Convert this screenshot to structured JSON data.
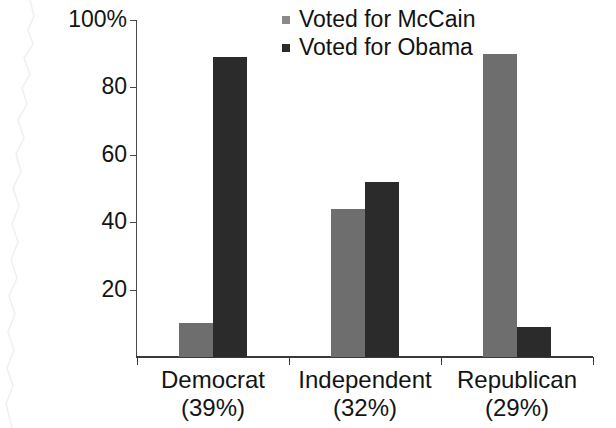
{
  "chart_data": {
    "type": "bar",
    "title": "",
    "subtitle": "",
    "xlabel": "",
    "ylabel": "",
    "ylim": [
      0,
      100
    ],
    "yticks": [
      20,
      40,
      60,
      80,
      100
    ],
    "ytick_labels": [
      "20",
      "40",
      "60",
      "80",
      "100%"
    ],
    "grid": false,
    "legend_position": "top-center",
    "categories": [
      "Democrat",
      "Independent",
      "Republican"
    ],
    "category_sublabels": [
      "(39%)",
      "(32%)",
      "(29%)"
    ],
    "series": [
      {
        "name": "Voted for McCain",
        "color": "#6e6e6e",
        "values": [
          10,
          44,
          90
        ]
      },
      {
        "name": "Voted for Obama",
        "color": "#2b2b2b",
        "values": [
          89,
          52,
          9
        ]
      }
    ]
  },
  "legend": {
    "items": [
      {
        "label": "Voted for McCain",
        "swatch": "legend-swatch-mccain"
      },
      {
        "label": "Voted for Obama",
        "swatch": "legend-swatch-obama"
      }
    ]
  },
  "axes": {
    "y": {
      "tick_labels": [
        "100%",
        "80",
        "60",
        "40",
        "20"
      ]
    },
    "x": {
      "categories": [
        {
          "name": "Democrat",
          "share": "(39%)"
        },
        {
          "name": "Independent",
          "share": "(32%)"
        },
        {
          "name": "Republican",
          "share": "(29%)"
        }
      ]
    }
  },
  "colors": {
    "mccain": "#6e6e6e",
    "obama": "#2b2b2b",
    "axis": "#3a3a3a",
    "text": "#141414",
    "background": "#ffffff"
  }
}
